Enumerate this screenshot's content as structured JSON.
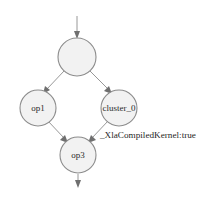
{
  "diagram": {
    "type": "directed-graph",
    "canvas": {
      "width": 220,
      "height": 203,
      "background": "#ffffff"
    },
    "style": {
      "node_fill": "#f2f2f2",
      "node_stroke": "#8c8c8c",
      "edge_stroke": "#8c8c8c",
      "arrowhead_fill": "#6f6f6f",
      "label_color": "#2b2b2b"
    },
    "nodes": [
      {
        "id": "root",
        "label": "",
        "cx": 77,
        "cy": 57,
        "r": 19
      },
      {
        "id": "op1",
        "label": "op1",
        "cx": 38,
        "cy": 108,
        "r": 18
      },
      {
        "id": "cluster_0",
        "label": "cluster_0",
        "cx": 119,
        "cy": 108,
        "r": 18
      },
      {
        "id": "op3",
        "label": "op3",
        "cx": 78,
        "cy": 155,
        "r": 18
      }
    ],
    "edges": [
      {
        "from": "entry",
        "to": "root"
      },
      {
        "from": "root",
        "to": "op1"
      },
      {
        "from": "root",
        "to": "cluster_0"
      },
      {
        "from": "op1",
        "to": "op3"
      },
      {
        "from": "cluster_0",
        "to": "op3"
      },
      {
        "from": "op3",
        "to": "exit"
      }
    ],
    "annotations": [
      {
        "id": "xla-attr",
        "text": "_XlaCompiledKernel:true",
        "x": 100,
        "y": 136,
        "attached_to": "cluster_0"
      }
    ],
    "watermark": {
      "text": "",
      "x": 110,
      "y": 188
    }
  }
}
